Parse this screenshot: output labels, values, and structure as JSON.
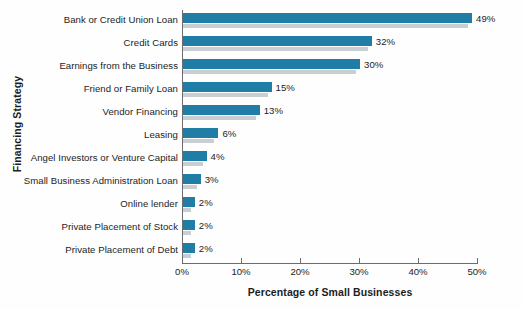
{
  "chart_data": {
    "type": "bar",
    "orientation": "horizontal",
    "title": "",
    "xlabel": "Percentage of Small Businesses",
    "ylabel": "Financing Strategy",
    "xlim": [
      0,
      50
    ],
    "xtick_labels": [
      "0%",
      "10%",
      "20%",
      "30%",
      "40%",
      "50%"
    ],
    "xtick_values": [
      0,
      10,
      20,
      30,
      40,
      50
    ],
    "grid": false,
    "legend": null,
    "categories": [
      "Bank or Credit Union Loan",
      "Credit Cards",
      "Earnings from the Business",
      "Friend or Family Loan",
      "Vendor Financing",
      "Leasing",
      "Angel Investors or Venture Capital",
      "Small Business Administration Loan",
      "Online lender",
      "Private Placement of Stock",
      "Private Placement of Debt"
    ],
    "values": [
      49,
      32,
      30,
      15,
      13,
      6,
      4,
      3,
      2,
      2,
      2
    ],
    "value_labels": [
      "49%",
      "32%",
      "30%",
      "15%",
      "13%",
      "6%",
      "4%",
      "3%",
      "2%",
      "2%",
      "2%"
    ],
    "colors": {
      "bar": "#1f7da6",
      "bar_shadow": "#c9ced3",
      "axis": "#6d6d6d",
      "text": "#1d1d1d",
      "background": "#fefefe"
    }
  }
}
